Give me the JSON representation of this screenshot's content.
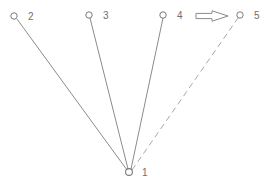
{
  "diagram": {
    "canvas": {
      "width": 269,
      "height": 187,
      "background": "#ffffff"
    },
    "colors": {
      "node_stroke": "#7a7a7a",
      "edge_solid": "#7e7e7e",
      "edge_dashed": "#a8a8a8",
      "arrow_stroke": "#8a8a8a",
      "label_text": "#6e6e6e"
    },
    "nodes": [
      {
        "id": "1",
        "label": "1",
        "cx": 129,
        "cy": 172,
        "r": 3.4,
        "label_x": 142,
        "label_y": 176
      },
      {
        "id": "2",
        "label": "2",
        "cx": 14,
        "cy": 16,
        "r": 3.2,
        "label_x": 28,
        "label_y": 20
      },
      {
        "id": "3",
        "label": "3",
        "cx": 89,
        "cy": 15,
        "r": 3.2,
        "label_x": 103,
        "label_y": 19
      },
      {
        "id": "4",
        "label": "4",
        "cx": 163,
        "cy": 15,
        "r": 3.2,
        "label_x": 177,
        "label_y": 19
      },
      {
        "id": "5",
        "label": "5",
        "cx": 240,
        "cy": 15,
        "r": 3.2,
        "label_x": 254,
        "label_y": 19
      }
    ],
    "edges": [
      {
        "id": "e12",
        "from": "1",
        "to": "2",
        "style": "solid",
        "x1": 127,
        "y1": 170,
        "x2": 17,
        "y2": 19
      },
      {
        "id": "e13",
        "from": "1",
        "to": "3",
        "style": "solid",
        "x1": 128,
        "y1": 169,
        "x2": 90,
        "y2": 18
      },
      {
        "id": "e14",
        "from": "1",
        "to": "4",
        "style": "solid",
        "x1": 131,
        "y1": 169,
        "x2": 163,
        "y2": 18
      },
      {
        "id": "e15",
        "from": "1",
        "to": "5",
        "style": "dashed",
        "x1": 132,
        "y1": 170,
        "x2": 238,
        "y2": 18,
        "dash": "6 4"
      }
    ],
    "arrow": {
      "name": "right-arrow-marker",
      "shaft_x1": 196,
      "shaft_x2": 212,
      "tip_x": 228,
      "center_y": 16,
      "shaft_half_height": 2.6,
      "head_half_height": 5.2
    }
  }
}
